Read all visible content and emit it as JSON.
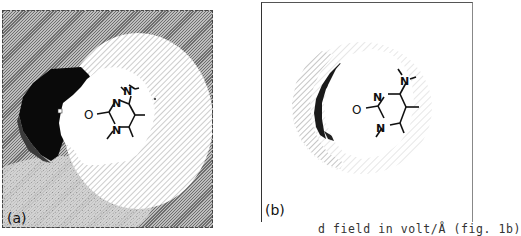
{
  "figure": {
    "panels": [
      {
        "id": "a",
        "label": "(a)",
        "atoms": {
          "n_top": "N",
          "n_bottom": "N",
          "oxygen": "O",
          "n_amine": "N"
        }
      },
      {
        "id": "b",
        "label": "(b)",
        "atoms": {
          "n_top": "N",
          "n_bottom": "N",
          "oxygen": "O",
          "n_amine": "N"
        }
      }
    ],
    "caption_fragment": "d field in volt/Å (fig. 1b)"
  }
}
